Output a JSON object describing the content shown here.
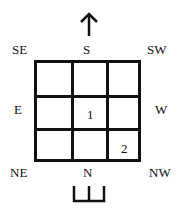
{
  "diagram": {
    "arrow_top": "up-arrow",
    "directions": {
      "se": "SE",
      "s": "S",
      "sw": "SW",
      "e": "E",
      "w": "W",
      "ne": "NE",
      "n": "N",
      "nw": "NW"
    },
    "grid": {
      "rows": 3,
      "cols": 3,
      "cells": [
        [
          "",
          "",
          ""
        ],
        [
          "",
          "1",
          ""
        ],
        [
          "",
          "",
          "2"
        ]
      ]
    },
    "bottom_symbol": "trident-base-symbol"
  }
}
